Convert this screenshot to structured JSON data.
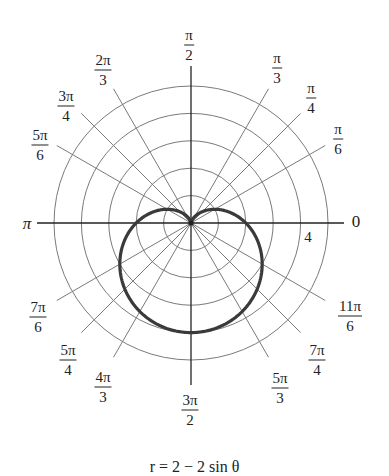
{
  "chart_data": {
    "type": "polar",
    "title": "",
    "caption": "r = 2 − 2 sin θ",
    "equation": "r = 2 - 2*sin(theta)",
    "series": [
      {
        "name": "r = 2 − 2 sin θ",
        "theta": [
          "0",
          "π/6",
          "π/4",
          "π/3",
          "π/2",
          "2π/3",
          "3π/4",
          "5π/6",
          "π",
          "7π/6",
          "5π/4",
          "4π/3",
          "3π/2",
          "5π/3",
          "7π/4",
          "11π/6"
        ],
        "r": [
          2,
          1,
          0.59,
          0.27,
          0,
          0.27,
          0.59,
          1,
          2,
          3,
          3.41,
          3.73,
          4,
          3.73,
          3.41,
          3
        ],
        "color": "#3a3a3a"
      }
    ],
    "radial_grid": [
      1,
      2,
      3,
      4,
      5
    ],
    "radial_label": {
      "value": "4",
      "at_circle": 4
    },
    "angle_labels": [
      {
        "angle_deg": 0,
        "label": "0",
        "num": "0",
        "den": ""
      },
      {
        "angle_deg": 30,
        "label": "π/6",
        "num": "π",
        "den": "6"
      },
      {
        "angle_deg": 45,
        "label": "π/4",
        "num": "π",
        "den": "4"
      },
      {
        "angle_deg": 60,
        "label": "π/3",
        "num": "π",
        "den": "3"
      },
      {
        "angle_deg": 90,
        "label": "π/2",
        "num": "π",
        "den": "2"
      },
      {
        "angle_deg": 120,
        "label": "2π/3",
        "num": "2π",
        "den": "3"
      },
      {
        "angle_deg": 135,
        "label": "3π/4",
        "num": "3π",
        "den": "4"
      },
      {
        "angle_deg": 150,
        "label": "5π/6",
        "num": "5π",
        "den": "6"
      },
      {
        "angle_deg": 180,
        "label": "π",
        "num": "π",
        "den": ""
      },
      {
        "angle_deg": 210,
        "label": "7π/6",
        "num": "7π",
        "den": "6"
      },
      {
        "angle_deg": 225,
        "label": "5π/4",
        "num": "5π",
        "den": "4"
      },
      {
        "angle_deg": 240,
        "label": "4π/3",
        "num": "4π",
        "den": "3"
      },
      {
        "angle_deg": 270,
        "label": "3π/2",
        "num": "3π",
        "den": "2"
      },
      {
        "angle_deg": 300,
        "label": "5π/3",
        "num": "5π",
        "den": "3"
      },
      {
        "angle_deg": 315,
        "label": "7π/4",
        "num": "7π",
        "den": "4"
      },
      {
        "angle_deg": 330,
        "label": "11π/6",
        "num": "11π",
        "den": "6"
      }
    ],
    "rlim": [
      0,
      5
    ],
    "grid": true,
    "legend": "none"
  },
  "colors": {
    "curve": "#3a3a3a",
    "grid": "#7a7a7a",
    "axes": "#222222",
    "text": "#222222"
  }
}
